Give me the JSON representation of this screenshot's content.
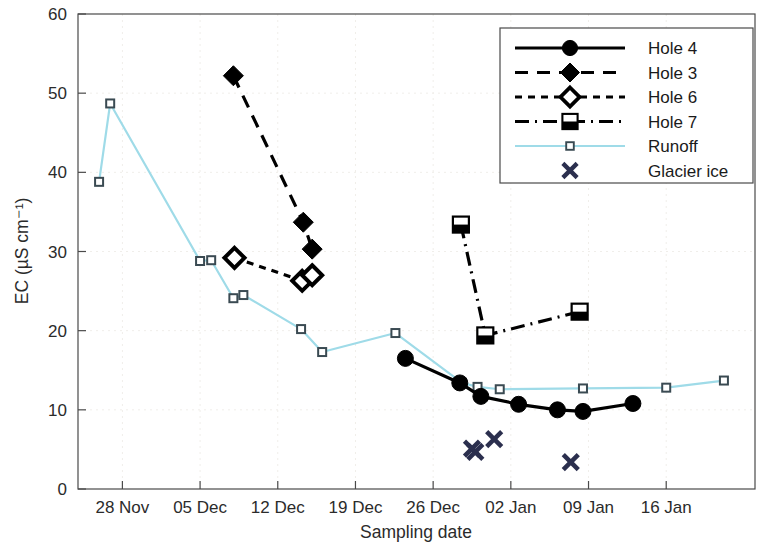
{
  "chart_data": {
    "type": "line",
    "title": "",
    "xlabel": "Sampling date",
    "ylabel": "EC (µS cm⁻¹)",
    "ylim": [
      0,
      60
    ],
    "yticks": [
      0,
      10,
      20,
      30,
      40,
      50,
      60
    ],
    "ytick_labels": [
      "0",
      "10",
      "20",
      "30",
      "40",
      "50",
      "60"
    ],
    "xticks": [
      4,
      11,
      18,
      25,
      32,
      39,
      46,
      53
    ],
    "xtick_labels": [
      "28 Nov",
      "05 Dec",
      "12 Dec",
      "19 Dec",
      "26 Dec",
      "02 Jan",
      "09 Jan",
      "16 Jan"
    ],
    "xlim": [
      0,
      61
    ],
    "grid": "faint",
    "legend_position": "top-right",
    "colors": {
      "hole4": "#000000",
      "hole3": "#000000",
      "hole6": "#000000",
      "hole7": "#000000",
      "runoff": "#9fdbe8",
      "glacier_ice": "#2b2f4e"
    },
    "series": [
      {
        "name": "Hole 4",
        "marker": "filled-circle",
        "line": "solid",
        "x": [
          29.5,
          34.4,
          36.3,
          39.7,
          43.2,
          45.5,
          50.0
        ],
        "y": [
          16.5,
          13.4,
          11.7,
          10.7,
          10.0,
          9.8,
          10.8
        ],
        "dates": [
          "30 Dec",
          "04 Jan",
          "06 Jan",
          "09 Jan",
          "13 Jan",
          "15 Jan",
          "19 Jan"
        ]
      },
      {
        "name": "Hole 3",
        "marker": "filled-diamond",
        "line": "dashed",
        "x": [
          14.0,
          20.3,
          21.1
        ],
        "y": [
          52.2,
          33.7,
          30.3
        ],
        "dates": [
          "08 Dec",
          "15 Dec",
          "16 Dec"
        ]
      },
      {
        "name": "Hole 6",
        "marker": "open-diamond",
        "line": "dotted-dashed",
        "x": [
          14.1,
          20.2,
          21.1
        ],
        "y": [
          29.2,
          26.3,
          27.0
        ],
        "dates": [
          "08 Dec",
          "15 Dec",
          "16 Dec"
        ]
      },
      {
        "name": "Hole 7",
        "marker": "half-filled-square",
        "line": "dash-dot",
        "x": [
          34.5,
          36.7,
          45.2
        ],
        "y": [
          33.4,
          19.4,
          22.4
        ],
        "dates": [
          "04 Jan",
          "06 Jan",
          "15 Jan"
        ]
      },
      {
        "name": "Runoff",
        "marker": "small-open-square",
        "line": "solid-thin",
        "x": [
          1.9,
          2.9,
          11.0,
          12.0,
          14.0,
          14.9,
          20.1,
          22.0,
          28.6,
          34.6,
          36.0,
          38.0,
          45.5,
          53.0,
          58.2
        ],
        "y": [
          38.8,
          48.7,
          28.8,
          28.9,
          24.1,
          24.5,
          20.2,
          17.3,
          19.7,
          13.4,
          12.9,
          12.6,
          12.7,
          12.8,
          13.7
        ],
        "dates": [
          "26 Nov",
          "27 Nov",
          "05 Dec",
          "06 Dec",
          "08 Dec",
          "09 Dec",
          "15 Dec",
          "16 Dec",
          "23 Dec",
          "04 Jan",
          "05 Jan",
          "07 Jan",
          "15 Jan",
          "22 Jan",
          "28 Jan"
        ]
      },
      {
        "name": "Glacier ice",
        "marker": "cross-x",
        "line": "none",
        "x": [
          35.5,
          35.8,
          37.5,
          44.4
        ],
        "y": [
          5.1,
          4.7,
          6.3,
          3.4
        ],
        "dates": [
          "05 Jan",
          "05 Jan",
          "07 Jan",
          "14 Jan"
        ]
      }
    ]
  },
  "legend": {
    "entries": [
      {
        "label": "Hole 4",
        "marker": "filled-circle",
        "line": "solid"
      },
      {
        "label": "Hole 3",
        "marker": "filled-diamond",
        "line": "dashed"
      },
      {
        "label": "Hole 6",
        "marker": "open-diamond",
        "line": "dotted-dashed"
      },
      {
        "label": "Hole 7",
        "marker": "half-filled-square",
        "line": "dash-dot"
      },
      {
        "label": "Runoff",
        "marker": "small-open-square",
        "line": "solid-thin"
      },
      {
        "label": "Glacier ice",
        "marker": "cross-x",
        "line": "none"
      }
    ]
  }
}
